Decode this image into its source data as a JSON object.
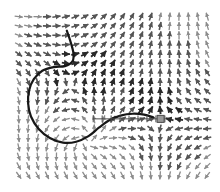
{
  "figure": {
    "width": 220,
    "height": 192,
    "background": "#ffffff",
    "plot_area": {
      "x": 14,
      "y": 12,
      "width": 198,
      "height": 168
    },
    "title": "",
    "xlabel": "",
    "ylabel": ""
  },
  "colors": {
    "arrow_dark": "#2a2a2a",
    "arrow_mid": "#555555",
    "arrow_light": "#8c8c8c",
    "curve": "#171717",
    "trajectory": "#4a4a4a",
    "marker_fill": "#999999",
    "marker_stroke": "#4a4a4a",
    "background": "#ffffff"
  },
  "chart_data": {
    "type": "scatter",
    "subtype": "quiver-vector-field",
    "title": "",
    "subtitle": "",
    "xlabel": "",
    "ylabel": "",
    "xlim": [
      0,
      21
    ],
    "ylim": [
      0,
      18
    ],
    "grid": false,
    "legend": null,
    "legend_position": "none",
    "annotations": [],
    "tick_labels": {
      "x": [],
      "y": []
    },
    "quiver": {
      "description": "Grayscale arrow field on a regular lattice; arrows rotate around a saddle/vortex structure near the left-centre and converge toward a stagnation point at the right-centre.",
      "grid_cols": 21,
      "grid_rows": 18,
      "cell_w": 9.4,
      "cell_h": 9.3,
      "arrow_length": 8.2,
      "vortex_center": {
        "x": 6.2,
        "y": 7.4
      },
      "saddle_center": {
        "x": 15.4,
        "y": 11.6
      },
      "vortex_strength": 1.0,
      "saddle_strength": 0.85,
      "uniform_flow": {
        "u": 0.12,
        "v": -0.05
      }
    },
    "curves": [
      {
        "name": "separatrix-loop",
        "style": "solid",
        "width": 2.2,
        "color": "#171717",
        "points": [
          [
            5.6,
            2.0
          ],
          [
            6.0,
            3.2
          ],
          [
            6.3,
            4.4
          ],
          [
            6.2,
            5.3
          ],
          [
            5.4,
            5.8
          ],
          [
            4.2,
            5.9
          ],
          [
            3.0,
            6.3
          ],
          [
            2.1,
            7.2
          ],
          [
            1.6,
            8.4
          ],
          [
            1.5,
            9.8
          ],
          [
            1.8,
            11.2
          ],
          [
            2.6,
            12.5
          ],
          [
            3.8,
            13.5
          ],
          [
            5.2,
            14.0
          ],
          [
            6.6,
            13.9
          ],
          [
            7.9,
            13.3
          ],
          [
            9.0,
            12.4
          ],
          [
            10.1,
            11.6
          ],
          [
            11.3,
            11.1
          ],
          [
            12.6,
            10.9
          ],
          [
            13.8,
            11.0
          ],
          [
            14.8,
            11.3
          ]
        ]
      }
    ],
    "trajectory": {
      "name": "horizontal-trajectory",
      "style": "solid-with-ticks",
      "width": 1.0,
      "color": "#4a4a4a",
      "y": 11.45,
      "x_start": 8.4,
      "x_end": 16.0,
      "tick_count": 9,
      "tick_height": 3.4
    },
    "markers": [
      {
        "name": "fixed-point-marker",
        "shape": "square",
        "x": 15.55,
        "y": 11.45,
        "size": 7,
        "fill": "#999999",
        "stroke": "#4a4a4a"
      }
    ]
  }
}
